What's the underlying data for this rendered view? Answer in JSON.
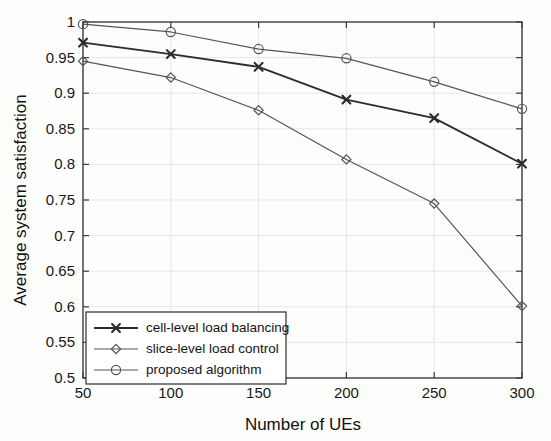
{
  "chart_data": {
    "type": "line",
    "title": "",
    "xlabel": "Number of UEs",
    "ylabel": "Average system satisfaction",
    "x": [
      50,
      100,
      150,
      200,
      250,
      300
    ],
    "xtick_labels": [
      "50",
      "100",
      "150",
      "200",
      "250",
      "300"
    ],
    "ytick_labels": [
      "0.5",
      "0.55",
      "0.6",
      "0.65",
      "0.7",
      "0.75",
      "0.8",
      "0.85",
      "0.9",
      "0.95",
      "1"
    ],
    "ytick_values": [
      0.5,
      0.55,
      0.6,
      0.65,
      0.7,
      0.75,
      0.8,
      0.85,
      0.9,
      0.95,
      1.0
    ],
    "xlim": [
      50,
      300
    ],
    "ylim": [
      0.5,
      1.0
    ],
    "grid": true,
    "legend_position": "lower left",
    "series": [
      {
        "name": "cell-level load balancing",
        "marker": "x",
        "color": "#2b2b2b",
        "line_width": 1.8,
        "values": [
          0.971,
          0.955,
          0.937,
          0.891,
          0.865,
          0.801
        ]
      },
      {
        "name": "slice-level load control",
        "marker": "diamond",
        "color": "#555555",
        "line_width": 1.2,
        "values": [
          0.945,
          0.922,
          0.876,
          0.807,
          0.745,
          0.601
        ]
      },
      {
        "name": "proposed algorithm",
        "marker": "circle",
        "color": "#555555",
        "line_width": 1.2,
        "values": [
          0.997,
          0.986,
          0.962,
          0.949,
          0.916,
          0.878
        ]
      }
    ]
  },
  "legend": {
    "items": [
      {
        "label": "cell-level load balancing",
        "marker": "x"
      },
      {
        "label": "slice-level load control",
        "marker": "diamond"
      },
      {
        "label": "proposed algorithm",
        "marker": "circle"
      }
    ]
  },
  "axes": {
    "x_title": "Number of UEs",
    "y_title": "Average system satisfaction"
  },
  "colors": {
    "axis": "#3a3a3a",
    "grid": "#d8d8d8",
    "series_primary": "#2b2b2b",
    "series_secondary": "#555555",
    "background": "#fdfdfc"
  }
}
